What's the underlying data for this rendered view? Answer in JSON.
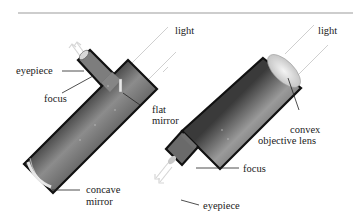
{
  "figure": {
    "rule_color": "#bdbdbd",
    "tube_dark": "#3e3e3e",
    "tube_mid": "#8a8a8a",
    "tube_light": "#c4c4c4",
    "outline": "#111111",
    "light_ray_color": "#cfcfcf"
  },
  "reflector": {
    "light_label": "light",
    "eyepiece_label": "eyepiece",
    "focus_label": "focus",
    "flat_mirror_label": "flat\nmirror",
    "flat_mirror_line1": "flat",
    "flat_mirror_line2": "mirror",
    "concave_mirror_line1": "concave",
    "concave_mirror_line2": "mirror"
  },
  "refractor": {
    "light_label": "light",
    "convex_line1": "convex",
    "convex_line2": "objective lens",
    "focus_label": "focus",
    "eyepiece_label": "eyepiece"
  }
}
